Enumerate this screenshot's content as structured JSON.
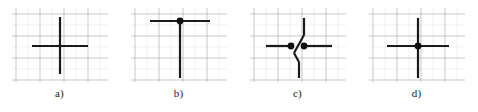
{
  "figure": {
    "background": "#ffffff",
    "panel_count": 4
  },
  "style": {
    "stroke_color": "#1a1a1a",
    "stroke_width": 2.2,
    "dot_color": "#111111",
    "dot_radius": 3.4,
    "grid_major_color": "#b9b9b9",
    "grid_minor_color": "#e6e6e6",
    "grid_major_width": 0.8,
    "grid_minor_width": 0.6,
    "label_color": "#1a1a1a"
  },
  "grid": {
    "major_x": [
      4,
      28,
      52,
      76
    ],
    "major_y": [
      6,
      28,
      50,
      72
    ],
    "minor_x": [
      16,
      40,
      64,
      88
    ],
    "minor_y": [
      17,
      39,
      61
    ],
    "width": 96,
    "height": 74
  },
  "panels": [
    {
      "id": "a",
      "label": "a)",
      "left": 0,
      "junction_type": "plain-crossing",
      "has_dot": false,
      "segments": [
        {
          "name": "vertical-line",
          "x1": 48,
          "y1": 9,
          "x2": 48,
          "y2": 66
        },
        {
          "name": "horizontal-line",
          "x1": 20,
          "y1": 38,
          "x2": 76,
          "y2": 38
        }
      ],
      "dots": []
    },
    {
      "id": "b",
      "label": "b)",
      "left": 119,
      "junction_type": "tee-junction",
      "has_dot": true,
      "segments": [
        {
          "name": "horizontal-top-bar",
          "x1": 19,
          "y1": 13,
          "x2": 79,
          "y2": 13
        },
        {
          "name": "vertical-stem",
          "x1": 49,
          "y1": 13,
          "x2": 49,
          "y2": 70
        }
      ],
      "dots": [
        {
          "name": "junction-dot",
          "cx": 49,
          "cy": 13
        }
      ]
    },
    {
      "id": "c",
      "label": "c)",
      "left": 238,
      "junction_type": "offset-jog-crossing",
      "has_dot": true,
      "segments": [
        {
          "name": "vertical-upper",
          "x1": 54,
          "y1": 10,
          "x2": 54,
          "y2": 27
        },
        {
          "name": "jog-diagonal-upper",
          "x1": 54,
          "y1": 27,
          "x2": 44,
          "y2": 45
        },
        {
          "name": "jog-diagonal-lower",
          "x1": 44,
          "y1": 45,
          "x2": 49,
          "y2": 54
        },
        {
          "name": "vertical-lower",
          "x1": 49,
          "y1": 54,
          "x2": 49,
          "y2": 70
        },
        {
          "name": "horizontal-left",
          "x1": 16,
          "y1": 38,
          "x2": 41,
          "y2": 38
        },
        {
          "name": "horizontal-right",
          "x1": 53,
          "y1": 38,
          "x2": 82,
          "y2": 38
        }
      ],
      "dots": [
        {
          "name": "left-junction-dot",
          "cx": 41,
          "cy": 38
        },
        {
          "name": "right-junction-dot",
          "cx": 54,
          "cy": 38
        }
      ]
    },
    {
      "id": "d",
      "label": "d)",
      "left": 357,
      "junction_type": "connected-crossing",
      "has_dot": true,
      "segments": [
        {
          "name": "vertical-line",
          "x1": 49,
          "y1": 10,
          "x2": 49,
          "y2": 70
        },
        {
          "name": "horizontal-line",
          "x1": 18,
          "y1": 38,
          "x2": 80,
          "y2": 38
        }
      ],
      "dots": [
        {
          "name": "junction-dot",
          "cx": 49,
          "cy": 38
        }
      ]
    }
  ]
}
